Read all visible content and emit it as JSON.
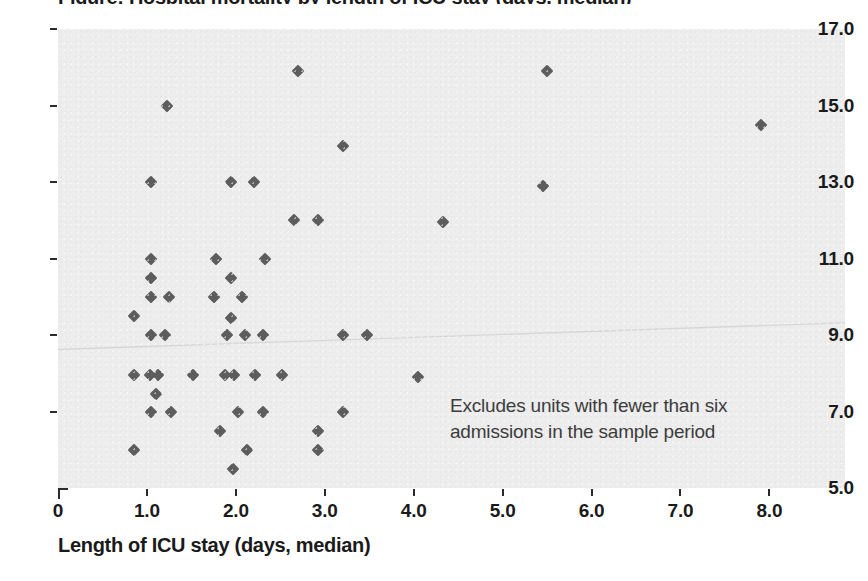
{
  "chart_data": {
    "type": "scatter",
    "title": "Figure: Hospital mortality by length of ICU stay (days, median)",
    "xlabel": "Length of ICU stay (days, median)",
    "ylabel": "",
    "xlim": [
      0,
      8.85
    ],
    "ylim": [
      5.0,
      17.0
    ],
    "grid": false,
    "legend": null,
    "xticks": [
      "0",
      "1.0",
      "2.0",
      "3.0",
      "4.0",
      "5.0",
      "6.0",
      "7.0",
      "8.0"
    ],
    "xtick_values": [
      0,
      1,
      2,
      3,
      4,
      5,
      6,
      7,
      8
    ],
    "yticks": [
      "17.0",
      "15.0",
      "13.0",
      "11.0",
      "9.0",
      "7.0",
      "5.0"
    ],
    "ytick_values": [
      17,
      15,
      13,
      11,
      9,
      7,
      5
    ],
    "marker": "diamond",
    "marker_color": "#5d5d5d",
    "plot_background": "#ededed",
    "annotation": {
      "line1": "Excludes units with fewer than six",
      "line2": "admissions in the sample period"
    },
    "trend_line": {
      "visible": true,
      "color": "#d8d8d8",
      "x_start": 0.0,
      "y_start": 8.62,
      "x_end": 8.85,
      "y_end": 9.32
    },
    "points": [
      {
        "x": 2.7,
        "y": 15.9
      },
      {
        "x": 5.5,
        "y": 15.9
      },
      {
        "x": 1.23,
        "y": 15.0
      },
      {
        "x": 7.9,
        "y": 14.5
      },
      {
        "x": 3.2,
        "y": 13.95
      },
      {
        "x": 1.05,
        "y": 13.0
      },
      {
        "x": 1.95,
        "y": 13.0
      },
      {
        "x": 2.2,
        "y": 13.0
      },
      {
        "x": 5.45,
        "y": 12.9
      },
      {
        "x": 2.65,
        "y": 12.0
      },
      {
        "x": 2.92,
        "y": 12.0
      },
      {
        "x": 4.33,
        "y": 11.95
      },
      {
        "x": 1.05,
        "y": 11.0
      },
      {
        "x": 1.78,
        "y": 11.0
      },
      {
        "x": 2.33,
        "y": 11.0
      },
      {
        "x": 1.05,
        "y": 10.5
      },
      {
        "x": 1.95,
        "y": 10.5
      },
      {
        "x": 1.05,
        "y": 10.0
      },
      {
        "x": 1.25,
        "y": 10.0
      },
      {
        "x": 1.75,
        "y": 10.0
      },
      {
        "x": 2.07,
        "y": 10.0
      },
      {
        "x": 0.85,
        "y": 9.5
      },
      {
        "x": 1.95,
        "y": 9.45
      },
      {
        "x": 1.05,
        "y": 9.0
      },
      {
        "x": 1.2,
        "y": 9.0
      },
      {
        "x": 1.9,
        "y": 9.0
      },
      {
        "x": 2.1,
        "y": 9.0
      },
      {
        "x": 2.3,
        "y": 9.0
      },
      {
        "x": 3.2,
        "y": 9.0
      },
      {
        "x": 3.48,
        "y": 9.0
      },
      {
        "x": 0.85,
        "y": 7.95
      },
      {
        "x": 1.03,
        "y": 7.95
      },
      {
        "x": 1.12,
        "y": 7.95
      },
      {
        "x": 1.52,
        "y": 7.95
      },
      {
        "x": 1.88,
        "y": 7.95
      },
      {
        "x": 1.98,
        "y": 7.95
      },
      {
        "x": 2.22,
        "y": 7.95
      },
      {
        "x": 2.52,
        "y": 7.95
      },
      {
        "x": 4.05,
        "y": 7.9
      },
      {
        "x": 1.1,
        "y": 7.45
      },
      {
        "x": 1.05,
        "y": 7.0
      },
      {
        "x": 1.27,
        "y": 7.0
      },
      {
        "x": 2.02,
        "y": 7.0
      },
      {
        "x": 2.3,
        "y": 7.0
      },
      {
        "x": 3.2,
        "y": 7.0
      },
      {
        "x": 1.82,
        "y": 6.5
      },
      {
        "x": 2.92,
        "y": 6.5
      },
      {
        "x": 0.85,
        "y": 6.0
      },
      {
        "x": 2.12,
        "y": 6.0
      },
      {
        "x": 2.92,
        "y": 6.0
      },
      {
        "x": 1.97,
        "y": 5.5
      }
    ]
  }
}
